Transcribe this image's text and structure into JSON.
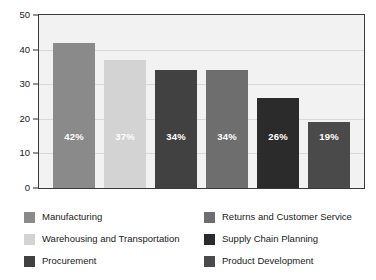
{
  "chart_data": {
    "type": "bar",
    "title": "",
    "subtitle": "",
    "xlabel": "",
    "ylabel": "",
    "ylim": [
      0,
      50
    ],
    "y_ticks": [
      "0",
      "10",
      "20",
      "30",
      "40",
      "50"
    ],
    "grid": true,
    "legend_position": "bottom",
    "categories": [
      "Manufacturing",
      "Warehousing and Transportation",
      "Procurement",
      "Returns and Customer Service",
      "Supply Chain Planning",
      "Product Development"
    ],
    "values": [
      42,
      37,
      34,
      34,
      26,
      19
    ],
    "data_labels": [
      "42%",
      "37%",
      "34%",
      "34%",
      "26%",
      "19%"
    ],
    "colors": [
      "#8a8a8a",
      "#d3d3d3",
      "#414141",
      "#6e6e6e",
      "#2b2b2b",
      "#4a4a4a"
    ]
  },
  "axis": {
    "y_ticks": [
      {
        "label": "50",
        "value": 50
      },
      {
        "label": "40",
        "value": 40
      },
      {
        "label": "30",
        "value": 30
      },
      {
        "label": "20",
        "value": 20
      },
      {
        "label": "10",
        "value": 10
      },
      {
        "label": "0",
        "value": 0
      }
    ]
  },
  "bars": [
    {
      "label": "Manufacturing",
      "value": 42,
      "data_label": "42%",
      "color": "#8a8a8a"
    },
    {
      "label": "Warehousing and Transportation",
      "value": 37,
      "data_label": "37%",
      "color": "#d3d3d3"
    },
    {
      "label": "Procurement",
      "value": 34,
      "data_label": "34%",
      "color": "#414141"
    },
    {
      "label": "Returns and Customer Service",
      "value": 34,
      "data_label": "34%",
      "color": "#6e6e6e"
    },
    {
      "label": "Supply Chain Planning",
      "value": 26,
      "data_label": "26%",
      "color": "#2b2b2b"
    },
    {
      "label": "Product Development",
      "value": 19,
      "data_label": "19%",
      "color": "#4a4a4a"
    }
  ],
  "legend": {
    "left_column": [
      {
        "label": "Manufacturing",
        "color": "#8a8a8a"
      },
      {
        "label": "Warehousing and Transportation",
        "color": "#d3d3d3"
      },
      {
        "label": "Procurement",
        "color": "#414141"
      }
    ],
    "right_column": [
      {
        "label": "Returns and Customer Service",
        "color": "#6e6e6e"
      },
      {
        "label": "Supply Chain Planning",
        "color": "#2b2b2b"
      },
      {
        "label": "Product Development",
        "color": "#4a4a4a"
      }
    ]
  }
}
